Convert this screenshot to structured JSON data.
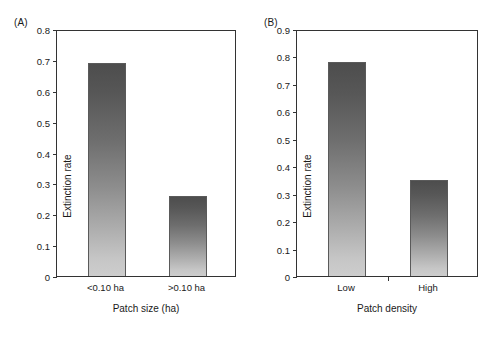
{
  "figure": {
    "panels": [
      {
        "tag": "(A)",
        "ylabel": "Extinction rate",
        "xlabel": "Patch size (ha)",
        "yticks": [
          "0.8",
          "0.7",
          "0.6",
          "0.5",
          "0.4",
          "0.3",
          "0.2",
          "0.1",
          "0"
        ],
        "categories": [
          "<0.10 ha",
          ">0.10 ha"
        ],
        "values": [
          0.69,
          0.26
        ]
      },
      {
        "tag": "(B)",
        "ylabel": "Extinction rate",
        "xlabel": "Patch density",
        "yticks": [
          "0.9",
          "0.8",
          "0.7",
          "0.6",
          "0.5",
          "0.4",
          "0.3",
          "0.2",
          "0.1",
          "0"
        ],
        "categories": [
          "Low",
          "High"
        ],
        "values": [
          0.78,
          0.35
        ]
      }
    ]
  },
  "chart_data": [
    {
      "type": "bar",
      "panel": "(A)",
      "title": "",
      "xlabel": "Patch size (ha)",
      "ylabel": "Extinction rate",
      "categories": [
        "<0.10 ha",
        ">0.10 ha"
      ],
      "values": [
        0.69,
        0.26
      ],
      "ylim": [
        0,
        0.8
      ],
      "ytick_values": [
        0,
        0.1,
        0.2,
        0.3,
        0.4,
        0.5,
        0.6,
        0.7,
        0.8
      ],
      "ytick_labels": [
        "0",
        "0.1",
        "0.2",
        "0.3",
        "0.4",
        "0.5",
        "0.6",
        "0.7",
        "0.8"
      ],
      "grid": false,
      "legend": "none",
      "bar_style": "vertical gradient, dark gray at top to light gray at bottom"
    },
    {
      "type": "bar",
      "panel": "(B)",
      "title": "",
      "xlabel": "Patch density",
      "ylabel": "Extinction rate",
      "categories": [
        "Low",
        "High"
      ],
      "values": [
        0.78,
        0.35
      ],
      "ylim": [
        0,
        0.9
      ],
      "ytick_values": [
        0,
        0.1,
        0.2,
        0.3,
        0.4,
        0.5,
        0.6,
        0.7,
        0.8,
        0.9
      ],
      "ytick_labels": [
        "0",
        "0.1",
        "0.2",
        "0.3",
        "0.4",
        "0.5",
        "0.6",
        "0.7",
        "0.8",
        "0.9"
      ],
      "grid": false,
      "legend": "none",
      "bar_style": "vertical gradient, dark gray at top to light gray at bottom"
    }
  ],
  "colors": {
    "bar_top": "#4d4d4d",
    "bar_bottom": "#cdcdcd",
    "axis": "#333333",
    "text": "#1a1a1a",
    "background": "#ffffff"
  }
}
